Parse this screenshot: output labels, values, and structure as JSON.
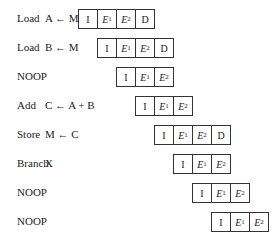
{
  "rows": [
    {
      "op": "Load",
      "args": "A ← M",
      "stages": [
        "I",
        "E1",
        "E2",
        "D"
      ],
      "offset": 0
    },
    {
      "op": "Load",
      "args": "B ← M",
      "stages": [
        "I",
        "E1",
        "E2",
        "D"
      ],
      "offset": 1
    },
    {
      "op": "NOOP",
      "args": "",
      "stages": [
        "I",
        "E1",
        "E2"
      ],
      "offset": 2
    },
    {
      "op": "Add",
      "args": "C ← A + B",
      "stages": [
        "I",
        "E1",
        "E2"
      ],
      "offset": 3
    },
    {
      "op": "Store",
      "args": "M ← C",
      "stages": [
        "I",
        "E1",
        "E2",
        "D"
      ],
      "offset": 4
    },
    {
      "op": "Branch",
      "args": "X",
      "stages": [
        "I",
        "E1",
        "E2"
      ],
      "offset": 5
    },
    {
      "op": "NOOP",
      "args": "",
      "stages": [
        "I",
        "E1",
        "E2"
      ],
      "offset": 6
    },
    {
      "op": "NOOP",
      "args": "",
      "stages": [
        "I",
        "E1",
        "E2"
      ],
      "offset": 7
    }
  ]
}
